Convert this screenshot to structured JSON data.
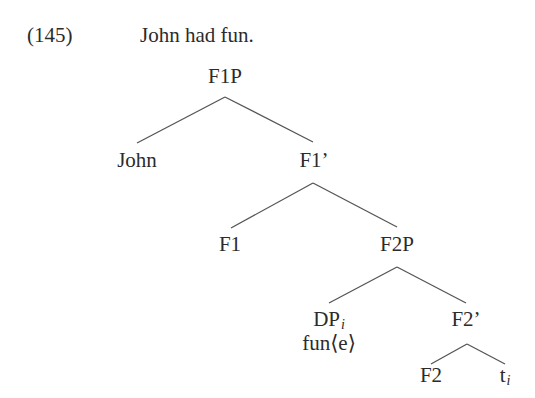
{
  "example": {
    "number": "(145)",
    "sentence": "John had fun."
  },
  "tree": {
    "nodes": {
      "f1p": {
        "label": "F1P"
      },
      "john": {
        "label": "John"
      },
      "f1bar": {
        "label": "F1’"
      },
      "f1": {
        "label": "F1"
      },
      "f2p": {
        "label": "F2P"
      },
      "dp": {
        "label": "DP",
        "index": "i"
      },
      "dp_annotation": {
        "label": "fun⟨e⟩"
      },
      "f2bar": {
        "label": "F2’"
      },
      "f2": {
        "label": "F2"
      },
      "trace": {
        "label": "t",
        "index": "i"
      }
    },
    "edges": [
      {
        "from": "F1P",
        "to": "John"
      },
      {
        "from": "F1P",
        "to": "F1’"
      },
      {
        "from": "F1’",
        "to": "F1"
      },
      {
        "from": "F1’",
        "to": "F2P"
      },
      {
        "from": "F2P",
        "to": "DP_i"
      },
      {
        "from": "F2P",
        "to": "F2’"
      },
      {
        "from": "F2’",
        "to": "F2"
      },
      {
        "from": "F2’",
        "to": "t_i"
      }
    ]
  },
  "colors": {
    "text": "#2b2b2b",
    "edge": "#555555",
    "background": "#ffffff"
  }
}
